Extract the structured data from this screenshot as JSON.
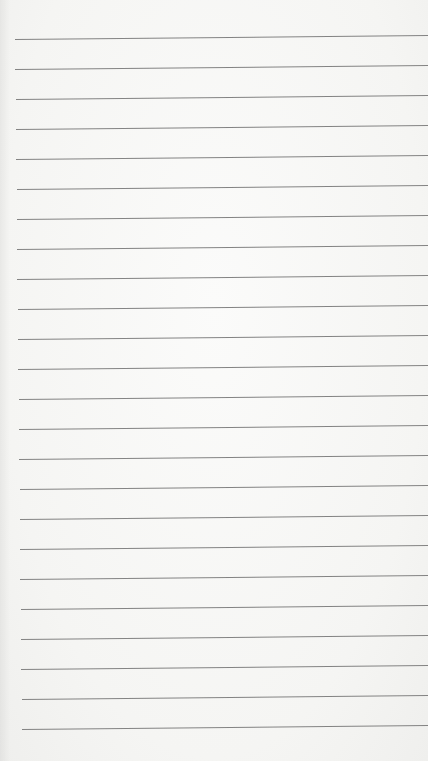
{
  "page": {
    "type": "lined-paper",
    "background_color": "#f7f7f5",
    "line_color": "#6e6e6e",
    "line_count": 24,
    "first_line_y": 39,
    "line_spacing": 30,
    "left_margin_top": 15,
    "left_margin_bottom": 22,
    "slope_px": -4
  }
}
